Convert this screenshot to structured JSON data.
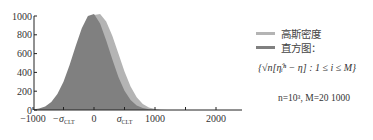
{
  "chart_data": {
    "type": "area",
    "title": "",
    "xlabel": "",
    "ylabel": "",
    "xlim": [
      -1000,
      2400
    ],
    "ylim": [
      0,
      1000
    ],
    "grid": false,
    "legend_position": "right",
    "x_ticks": [
      {
        "value": -1000,
        "label": "−1000"
      },
      {
        "value": -500,
        "label": "−σ",
        "sub": "CLT"
      },
      {
        "value": 0,
        "label": "0"
      },
      {
        "value": 500,
        "label": "σ",
        "sub": "CLT"
      },
      {
        "value": 1000,
        "label": "1000"
      },
      {
        "value": 1500,
        "label": ""
      },
      {
        "value": 2000,
        "label": "2000"
      }
    ],
    "y_ticks": [
      0,
      200,
      400,
      600,
      800,
      1000
    ],
    "x": [
      -1000,
      -900,
      -800,
      -700,
      -600,
      -500,
      -400,
      -300,
      -200,
      -100,
      0,
      100,
      200,
      300,
      400,
      500,
      600,
      700,
      800,
      900,
      1000,
      1100,
      1200
    ],
    "series": [
      {
        "name": "高斯密度",
        "color": "#b4b4b4",
        "values": [
          4,
          10,
          25,
          60,
          125,
          230,
          380,
          560,
          750,
          910,
          1010,
          1020,
          940,
          790,
          600,
          410,
          250,
          135,
          65,
          28,
          10,
          3,
          1
        ]
      },
      {
        "name": "直方图",
        "color": "#808080",
        "values": [
          6,
          15,
          38,
          85,
          170,
          300,
          480,
          680,
          870,
          1000,
          1020,
          920,
          740,
          540,
          350,
          205,
          105,
          48,
          20,
          8,
          3,
          1,
          0
        ]
      }
    ]
  },
  "axes": {
    "y_labels": [
      "0",
      "200",
      "400",
      "600",
      "800",
      "1000"
    ],
    "x_labels": [
      "−1000",
      "−σ",
      "0",
      "σ",
      "1000",
      "2000"
    ],
    "sigma_subscript": "CLT"
  },
  "legend": {
    "items": [
      {
        "label": "高斯密度",
        "color": "#b4b4b4"
      },
      {
        "label": "直方图：",
        "color": "#808080"
      }
    ],
    "formula": "{√n[η̂ᵢⁿ − η] : 1 ≤ i ≤ M}",
    "params": "n=10³,  M=20 1000"
  }
}
